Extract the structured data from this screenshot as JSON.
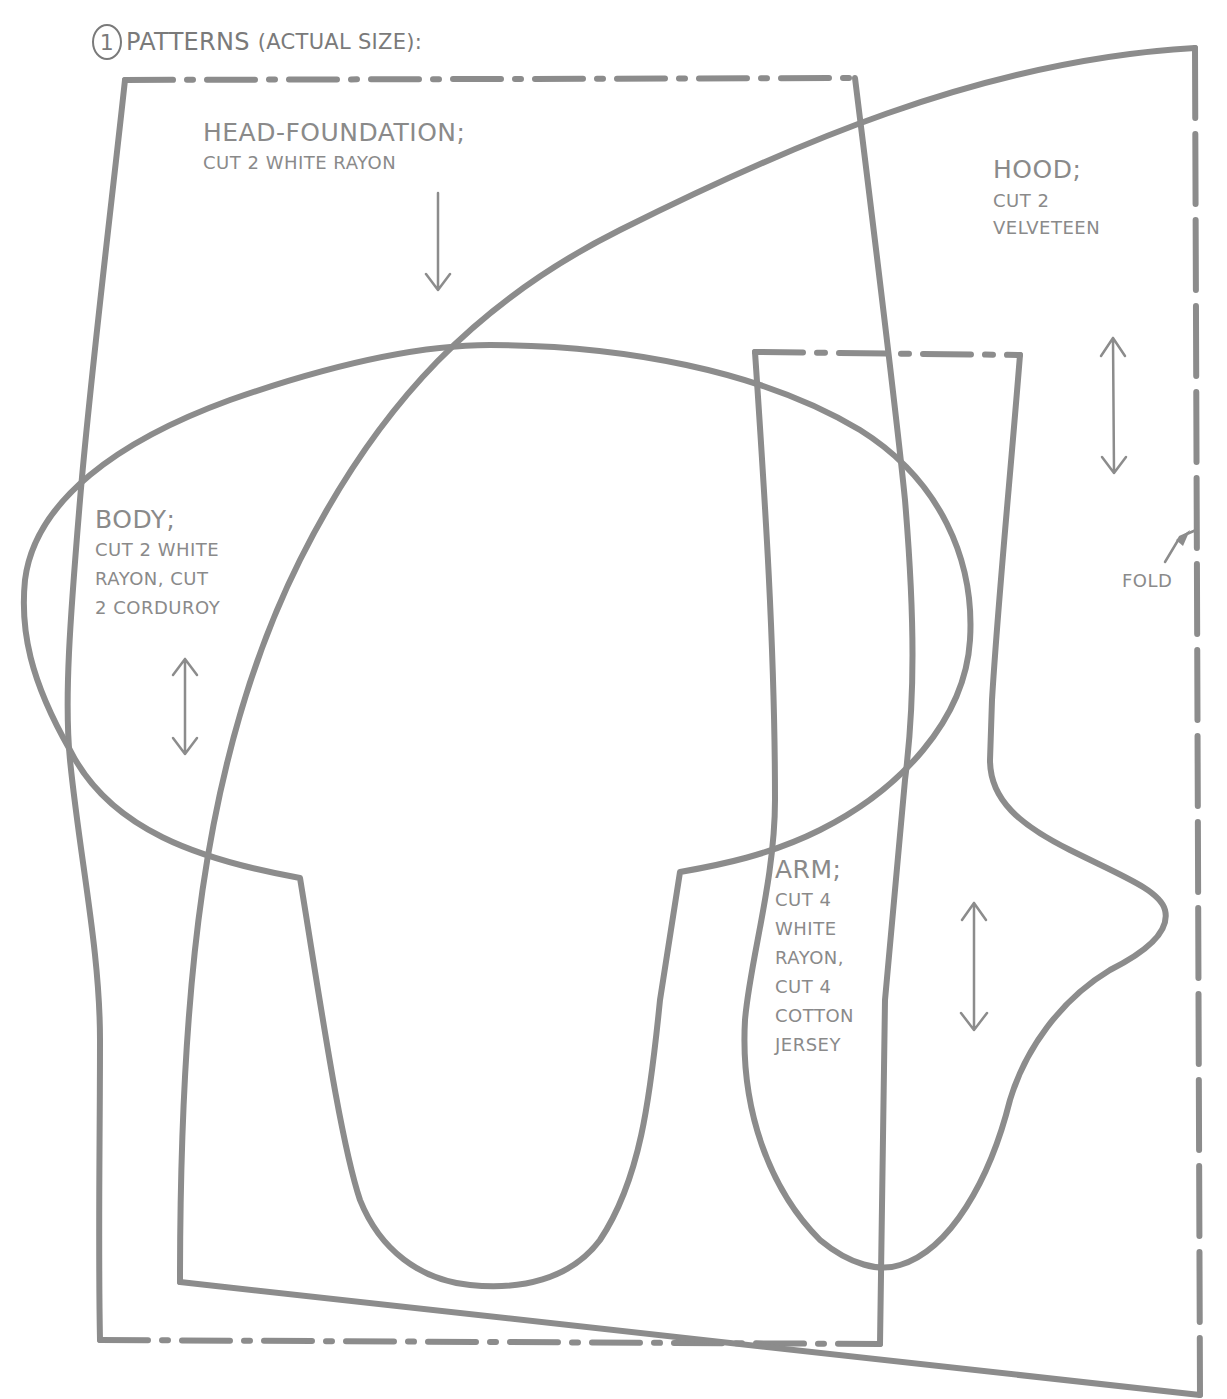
{
  "header": {
    "step_number": "1",
    "title": "PATTERNS",
    "subtitle": "(ACTUAL SIZE):"
  },
  "pieces": [
    {
      "name": "HEAD-FOUNDATION;",
      "instructions": [
        "CUT 2 WHITE RAYON"
      ],
      "grain_arrow": "down-arrow"
    },
    {
      "name": "HOOD;",
      "instructions": [
        "CUT 2",
        "VELVETEEN"
      ],
      "grain_arrow": "double-headed-vertical-arrow"
    },
    {
      "name": "BODY;",
      "instructions": [
        "CUT 2 WHITE",
        "RAYON, CUT",
        "2 CORDUROY"
      ],
      "grain_arrow": "double-headed-vertical-arrow"
    },
    {
      "name": "ARM;",
      "instructions": [
        "CUT 4",
        "WHITE",
        "RAYON,",
        "CUT 4",
        "COTTON",
        "JERSEY"
      ],
      "grain_arrow": "double-headed-vertical-arrow"
    }
  ],
  "annotations": {
    "fold": "FOLD"
  },
  "colors": {
    "line": "#8c8c8c",
    "text": "#8a8a8a",
    "background": "#ffffff"
  }
}
